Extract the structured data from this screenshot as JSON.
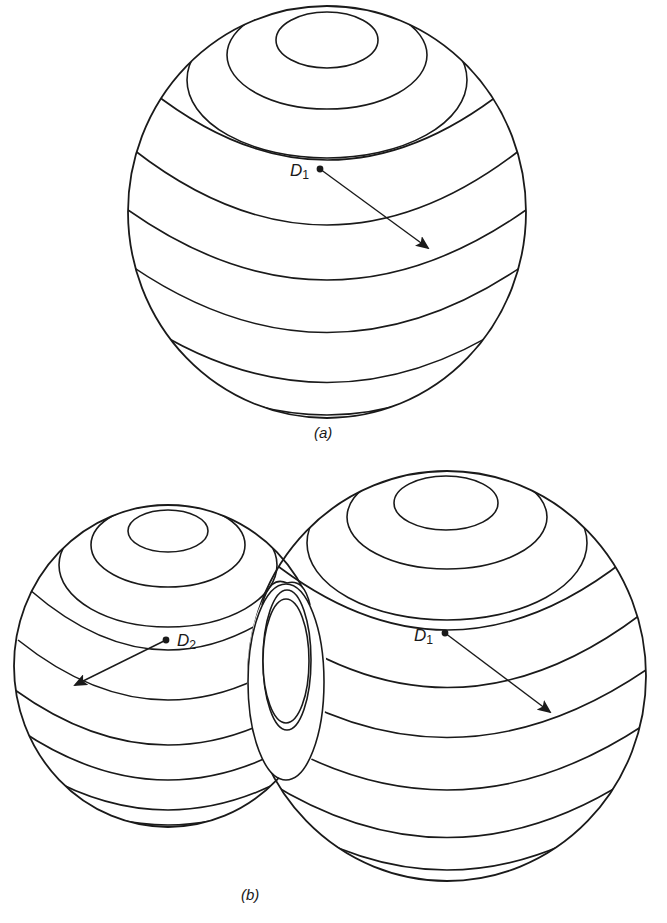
{
  "figure": {
    "panels": [
      {
        "id": "a",
        "caption": "(a)",
        "spheres": [
          {
            "name": "D1",
            "label_main": "D",
            "label_sub": "1",
            "description": "single sphere with latitude rings and radius arrow"
          }
        ]
      },
      {
        "id": "b",
        "caption": "(b)",
        "spheres": [
          {
            "name": "D2",
            "label_main": "D",
            "label_sub": "2",
            "description": "smaller sphere with radius arrow pointing lower-left"
          },
          {
            "name": "D1",
            "label_main": "D",
            "label_sub": "1",
            "description": "larger sphere overlapping the smaller one, radius arrow pointing lower-right"
          }
        ],
        "overlap": "intersection region shown as nested ellipses"
      }
    ],
    "colors": {
      "line": "#1a1a1a",
      "background": "#ffffff"
    }
  }
}
